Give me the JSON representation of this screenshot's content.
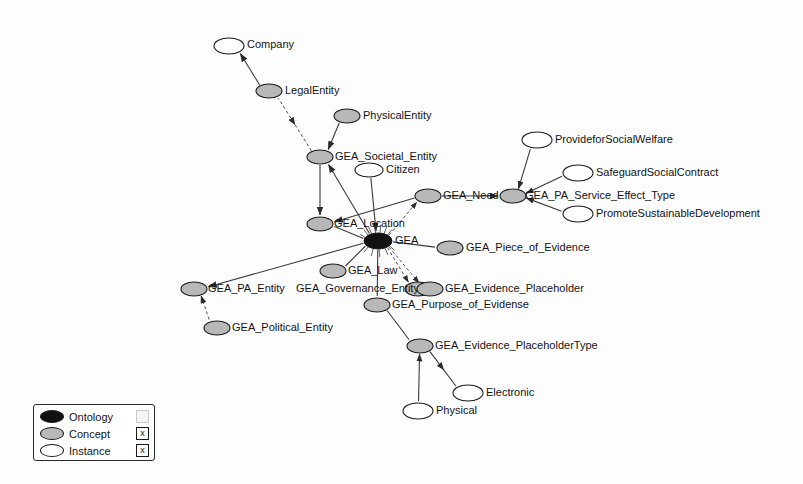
{
  "diagram": {
    "width": 803,
    "height": 484,
    "background": "#fdfdfd"
  },
  "styles": {
    "ontology_fill": "#111111",
    "concept_fill": "#b8b8b8",
    "instance_fill": "#ffffff",
    "stroke": "#1a1a1a",
    "edge_color": "#3a3a3a",
    "text_color": "#131313"
  },
  "nodes": [
    {
      "id": "Company",
      "label": "Company",
      "type": "instance",
      "x": 229,
      "y": 46,
      "rx": 15,
      "ry": 8,
      "label_dx": 18,
      "label_dy": -1,
      "anchor": "start"
    },
    {
      "id": "LegalEntity",
      "label": "LegalEntity",
      "type": "concept",
      "x": 269,
      "y": 91,
      "rx": 13,
      "ry": 7,
      "label_dx": 16,
      "label_dy": 0,
      "anchor": "start"
    },
    {
      "id": "PhysicalEntity",
      "label": "PhysicalEntity",
      "type": "concept",
      "x": 347,
      "y": 116,
      "rx": 13,
      "ry": 7,
      "label_dx": 16,
      "label_dy": 0,
      "anchor": "start"
    },
    {
      "id": "GEA_Societal_Entity",
      "label": "GEA_Societal_Entity",
      "type": "concept",
      "x": 320,
      "y": 157,
      "rx": 13,
      "ry": 7,
      "label_dx": 15,
      "label_dy": 0,
      "anchor": "start"
    },
    {
      "id": "Citizen",
      "label": "Citizen",
      "type": "instance",
      "x": 369,
      "y": 170,
      "rx": 14,
      "ry": 7,
      "label_dx": 17,
      "label_dy": 0,
      "anchor": "start"
    },
    {
      "id": "GEA_Need",
      "label": "GEA_Need",
      "type": "concept",
      "x": 428,
      "y": 196,
      "rx": 13,
      "ry": 7,
      "label_dx": 15,
      "label_dy": 0,
      "anchor": "start"
    },
    {
      "id": "GEA_PA_Service_Effect_Type",
      "label": "GEA_PA_Service_Effect_Type",
      "type": "concept",
      "x": 513,
      "y": 196,
      "rx": 13,
      "ry": 7,
      "label_dx": 12,
      "label_dy": 0,
      "anchor": "start"
    },
    {
      "id": "ProvideforSocialWelfare",
      "label": "ProvideforSocialWelfare",
      "type": "instance",
      "x": 537,
      "y": 140,
      "rx": 15,
      "ry": 8,
      "label_dx": 18,
      "label_dy": 0,
      "anchor": "start"
    },
    {
      "id": "SafeguardSocialContract",
      "label": "SafeguardSocialContract",
      "type": "instance",
      "x": 578,
      "y": 173,
      "rx": 15,
      "ry": 8,
      "label_dx": 18,
      "label_dy": 0,
      "anchor": "start"
    },
    {
      "id": "PromoteSustainableDevelopment",
      "label": "PromoteSustainableDevelopment",
      "type": "instance",
      "x": 578,
      "y": 214,
      "rx": 15,
      "ry": 8,
      "label_dx": 18,
      "label_dy": 0,
      "anchor": "start"
    },
    {
      "id": "GEA_Location",
      "label": "GEA_Location",
      "type": "concept",
      "x": 320,
      "y": 224,
      "rx": 13,
      "ry": 7,
      "label_dx": 14,
      "label_dy": 0,
      "anchor": "start"
    },
    {
      "id": "GEA",
      "label": "GEA",
      "type": "ontology",
      "x": 378,
      "y": 241,
      "rx": 14,
      "ry": 8,
      "label_dx": 17,
      "label_dy": 0,
      "anchor": "start"
    },
    {
      "id": "GEA_Piece_of_Evidence",
      "label": "GEA_Piece_of_Evidence",
      "type": "concept",
      "x": 450,
      "y": 248,
      "rx": 13,
      "ry": 7,
      "label_dx": 16,
      "label_dy": 0,
      "anchor": "start"
    },
    {
      "id": "GEA_Law",
      "label": "GEA_Law",
      "type": "concept",
      "x": 333,
      "y": 271,
      "rx": 13,
      "ry": 7,
      "label_dx": 15,
      "label_dy": 0,
      "anchor": "start"
    },
    {
      "id": "GEA_PA_Entity",
      "label": "GEA_PA_Entity",
      "type": "concept",
      "x": 194,
      "y": 289,
      "rx": 13,
      "ry": 7,
      "label_dx": 14,
      "label_dy": 0,
      "anchor": "start"
    },
    {
      "id": "GEA_Governance_Entity",
      "label": "GEA_Governance_Entity",
      "type": "concept",
      "x": 418,
      "y": 289,
      "rx": 13,
      "ry": 7,
      "label_dx": -122,
      "label_dy": 0,
      "anchor": "start"
    },
    {
      "id": "GEA_Evidence_Placeholder",
      "label": "GEA_Evidence_Placeholder",
      "type": "concept",
      "x": 430,
      "y": 289,
      "rx": 13,
      "ry": 7,
      "label_dx": 15,
      "label_dy": 0,
      "anchor": "start"
    },
    {
      "id": "GEA_Purpose_of_Evidense",
      "label": "GEA_Purpose_of_Evidense",
      "type": "concept",
      "x": 377,
      "y": 305,
      "rx": 13,
      "ry": 7,
      "label_dx": 15,
      "label_dy": 0,
      "anchor": "start"
    },
    {
      "id": "GEA_Political_Entity",
      "label": "GEA_Political_Entity",
      "type": "concept",
      "x": 217,
      "y": 328,
      "rx": 13,
      "ry": 7,
      "label_dx": 15,
      "label_dy": 0,
      "anchor": "start"
    },
    {
      "id": "GEA_Evidence_PlaceholderType",
      "label": "GEA_Evidence_PlaceholderType",
      "type": "concept",
      "x": 420,
      "y": 346,
      "rx": 13,
      "ry": 7,
      "label_dx": 15,
      "label_dy": 0,
      "anchor": "start"
    },
    {
      "id": "Electronic",
      "label": "Electronic",
      "type": "instance",
      "x": 468,
      "y": 393,
      "rx": 15,
      "ry": 8,
      "label_dx": 18,
      "label_dy": 0,
      "anchor": "start"
    },
    {
      "id": "Physical",
      "label": "Physical",
      "type": "instance",
      "x": 418,
      "y": 411,
      "rx": 15,
      "ry": 8,
      "label_dx": 18,
      "label_dy": 0,
      "anchor": "start"
    }
  ],
  "edges": [
    {
      "from": "LegalEntity",
      "to": "Company",
      "arrow": "end",
      "style": "solid"
    },
    {
      "from": "GEA_Societal_Entity",
      "to": "LegalEntity",
      "arrow": "mid-reverse",
      "style": "dashed"
    },
    {
      "from": "PhysicalEntity",
      "to": "GEA_Societal_Entity",
      "arrow": "end",
      "style": "solid"
    },
    {
      "from": "GEA",
      "to": "GEA_Societal_Entity",
      "arrow": "end",
      "style": "solid"
    },
    {
      "from": "GEA_Societal_Entity",
      "to": "GEA_Location",
      "arrow": "end",
      "style": "solid"
    },
    {
      "from": "Citizen",
      "to": "GEA",
      "arrow": "end",
      "style": "solid"
    },
    {
      "from": "GEA",
      "to": "GEA_Location",
      "arrow": "none",
      "style": "solid"
    },
    {
      "from": "GEA_Need",
      "to": "GEA_Location",
      "arrow": "end",
      "style": "solid"
    },
    {
      "from": "GEA",
      "to": "GEA_Need",
      "arrow": "end",
      "style": "dashed"
    },
    {
      "from": "GEA_Need",
      "to": "GEA_PA_Service_Effect_Type",
      "arrow": "end",
      "style": "solid"
    },
    {
      "from": "GEA_PA_Service_Effect_Type",
      "to": "ProvideforSocialWelfare",
      "arrow": "start",
      "style": "solid"
    },
    {
      "from": "GEA_PA_Service_Effect_Type",
      "to": "SafeguardSocialContract",
      "arrow": "start",
      "style": "solid"
    },
    {
      "from": "GEA_PA_Service_Effect_Type",
      "to": "PromoteSustainableDevelopment",
      "arrow": "start",
      "style": "solid"
    },
    {
      "from": "GEA",
      "to": "GEA_Piece_of_Evidence",
      "arrow": "none",
      "style": "solid"
    },
    {
      "from": "GEA",
      "to": "GEA_Law",
      "arrow": "none",
      "style": "solid"
    },
    {
      "from": "GEA",
      "to": "GEA_PA_Entity",
      "arrow": "end",
      "style": "solid"
    },
    {
      "from": "GEA",
      "to": "GEA_Governance_Entity",
      "arrow": "end",
      "style": "dashed"
    },
    {
      "from": "GEA_PA_Entity",
      "to": "GEA_Political_Entity",
      "arrow": "start",
      "style": "dashed"
    },
    {
      "from": "GEA",
      "to": "GEA_Evidence_Placeholder",
      "arrow": "end",
      "style": "dashed"
    },
    {
      "from": "GEA",
      "to": "GEA_Purpose_of_Evidense",
      "arrow": "none",
      "style": "solid"
    },
    {
      "from": "GEA_Purpose_of_Evidense",
      "to": "GEA_Evidence_PlaceholderType",
      "arrow": "none",
      "style": "solid"
    },
    {
      "from": "GEA_Evidence_PlaceholderType",
      "to": "Physical",
      "arrow": "start",
      "style": "solid"
    },
    {
      "from": "GEA_Evidence_PlaceholderType",
      "to": "Electronic",
      "arrow": "mid",
      "style": "solid"
    }
  ],
  "legend": {
    "x": 33,
    "y": 404,
    "width": 122,
    "height": 57,
    "rows": [
      {
        "label": "Ontology",
        "swatch": "#111111",
        "checkbox": "",
        "checked": false
      },
      {
        "label": "Concept",
        "swatch": "#b8b8b8",
        "checkbox": "x",
        "checked": true
      },
      {
        "label": "Instance",
        "swatch": "#ffffff",
        "checkbox": "x",
        "checked": true
      }
    ]
  }
}
